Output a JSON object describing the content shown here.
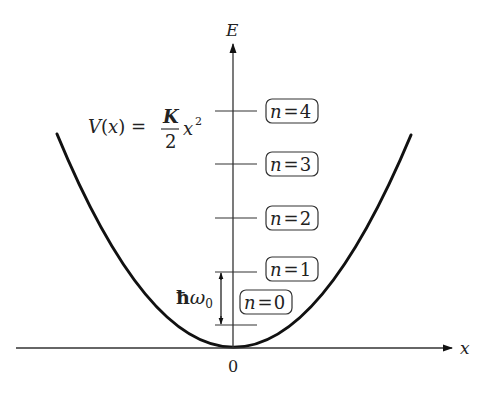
{
  "diagram": {
    "axes": {
      "x_label": "x",
      "y_label": "E",
      "origin_label": "0"
    },
    "potential": {
      "lhs": "V(x) =",
      "numerator": "K",
      "denominator": "2",
      "variable": "x",
      "exponent": "2"
    },
    "spacing_label": {
      "hbar": "ħ",
      "omega": "ω",
      "subscript": "0"
    },
    "levels": [
      {
        "n": "n = 0",
        "var": "n",
        "eq": "=",
        "val": "0"
      },
      {
        "n": "n = 1",
        "var": "n",
        "eq": "=",
        "val": "1"
      },
      {
        "n": "n = 2",
        "var": "n",
        "eq": "=",
        "val": "2"
      },
      {
        "n": "n = 3",
        "var": "n",
        "eq": "=",
        "val": "3"
      },
      {
        "n": "n = 4",
        "var": "n",
        "eq": "=",
        "val": "4"
      }
    ],
    "colors": {
      "line": "#111111",
      "text": "#222222",
      "background": "#ffffff"
    }
  }
}
